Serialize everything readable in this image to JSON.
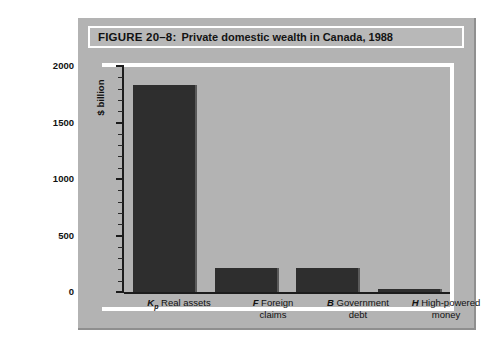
{
  "figure": {
    "number": "FIGURE 20–8:",
    "title": "Private domestic wealth in Canada, 1988"
  },
  "chart_data": {
    "type": "bar",
    "title": "Private domestic wealth in Canada, 1988",
    "xlabel": "",
    "ylabel": "$ billion",
    "ylim": [
      0,
      2000
    ],
    "ytick_labels": [
      "0",
      "500",
      "1000",
      "1500",
      "2000"
    ],
    "ytick_values": [
      0,
      500,
      1000,
      1500,
      2000
    ],
    "minor_tick_interval": 100,
    "grid": false,
    "legend": "none",
    "categories": [
      "Kₚ Real assets",
      "F Foreign claims",
      "B Government debt",
      "H High-powered money"
    ],
    "category_symbols": [
      "K",
      "F",
      "B",
      "H"
    ],
    "category_subscripts": [
      "p",
      "",
      "",
      ""
    ],
    "category_names": [
      "Real assets",
      "Foreign claims",
      "Government debt",
      "High-powered money"
    ],
    "values": [
      1830,
      215,
      215,
      30
    ],
    "bar_color": "#2e2e2e"
  },
  "axis": {
    "y_label": "$ billion",
    "ticks": [
      "2000",
      "1500",
      "1000",
      "500",
      "0"
    ]
  },
  "labels": {
    "cat1_symbol": "K",
    "cat1_sub": "p",
    "cat1_line1": "Real assets",
    "cat1_line2": "",
    "cat2_symbol": "F",
    "cat2_line1": "Foreign",
    "cat2_line2": "claims",
    "cat3_symbol": "B",
    "cat3_line1": "Government",
    "cat3_line2": "debt",
    "cat4_symbol": "H",
    "cat4_line1": "High-powered",
    "cat4_line2": "money"
  },
  "colors": {
    "figure_background": "#b3b3b3",
    "bar": "#2e2e2e",
    "frame": "#ffffff",
    "axis": "#1c1c1c"
  }
}
